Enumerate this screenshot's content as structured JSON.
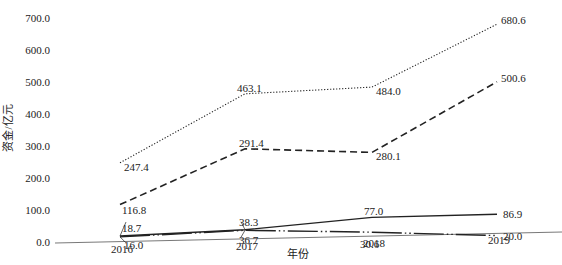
{
  "chart_data": {
    "type": "line",
    "title": "",
    "xlabel": "年份",
    "ylabel": "资金/亿元",
    "categories": [
      "2016",
      "2017",
      "2018",
      "2019"
    ],
    "ylim": [
      0,
      700
    ],
    "yticks": [
      "0.0",
      "100.0",
      "200.0",
      "300.0",
      "400.0",
      "500.0",
      "600.0",
      "700.0"
    ],
    "grid": false,
    "legend": "none",
    "series": [
      {
        "name": "series-dotted",
        "style": "dotted",
        "values": [
          247.4,
          463.1,
          484.0,
          680.6
        ],
        "labels": [
          "247.4",
          "463.1",
          "484.0",
          "680.6"
        ]
      },
      {
        "name": "series-dashed",
        "style": "dashed",
        "values": [
          116.8,
          291.4,
          280.1,
          500.6
        ],
        "labels": [
          "116.8",
          "291.4",
          "280.1",
          "500.6"
        ]
      },
      {
        "name": "series-solid",
        "style": "solid",
        "values": [
          18.7,
          38.3,
          77.0,
          86.9
        ],
        "labels": [
          "18.7",
          "38.3",
          "77.0",
          "86.9"
        ]
      },
      {
        "name": "series-dash-dot-dot",
        "style": "dash-dot-dot",
        "values": [
          16.0,
          36.7,
          30.6,
          20.0
        ],
        "labels": [
          "16.0",
          "36.7",
          "30.6",
          "20.0"
        ]
      }
    ]
  }
}
